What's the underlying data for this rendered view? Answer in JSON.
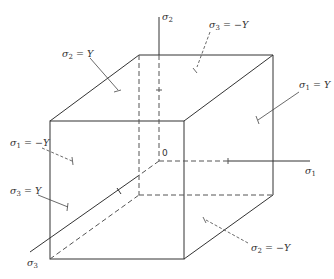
{
  "diagram": {
    "type": "yield-surface-cube",
    "axes": {
      "sigma1": {
        "symbol": "σ",
        "subscript": "1"
      },
      "sigma2": {
        "symbol": "σ",
        "subscript": "2"
      },
      "sigma3": {
        "symbol": "σ",
        "subscript": "3"
      },
      "origin": "0"
    },
    "face_labels": [
      {
        "id": "sigma2-pos",
        "symbol": "σ",
        "subscript": "2",
        "relation": " = Y"
      },
      {
        "id": "sigma3-neg",
        "symbol": "σ",
        "subscript": "3",
        "relation": " = −Y"
      },
      {
        "id": "sigma1-pos",
        "symbol": "σ",
        "subscript": "1",
        "relation": " = Y"
      },
      {
        "id": "sigma1-neg",
        "symbol": "σ",
        "subscript": "1",
        "relation": " = −Y"
      },
      {
        "id": "sigma3-pos",
        "symbol": "σ",
        "subscript": "3",
        "relation": " = Y"
      },
      {
        "id": "sigma2-neg",
        "symbol": "σ",
        "subscript": "2",
        "relation": " = −Y"
      }
    ],
    "colors": {
      "line": "#333333",
      "dashed": "#555555",
      "background": "#ffffff"
    }
  }
}
